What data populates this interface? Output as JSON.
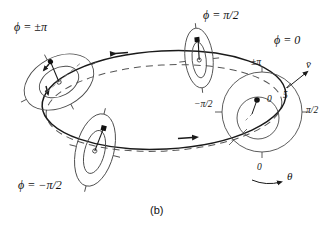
{
  "figure": {
    "caption": "(b)",
    "type": "phase-portrait-torus-diagram"
  },
  "phase_labels": {
    "phi_pm_pi": "ϕ = ±π",
    "phi_pi_half": "ϕ = π/2",
    "phi_zero": "ϕ = 0",
    "phi_minus_pi_half": "ϕ = −π/2"
  },
  "polar_axis": {
    "tick_top": "±π",
    "tick_left": "−π/2",
    "tick_right": "π/2",
    "tick_bottom": "0",
    "radial_outer": "5",
    "radial_inner": "0",
    "angle_symbol": "θ",
    "velocity_symbol": "v̄"
  },
  "colors": {
    "stroke": "#1a1a1a",
    "thin_stroke": "#4a4a4a",
    "dashed_stroke": "#555555",
    "background": "#ffffff"
  }
}
